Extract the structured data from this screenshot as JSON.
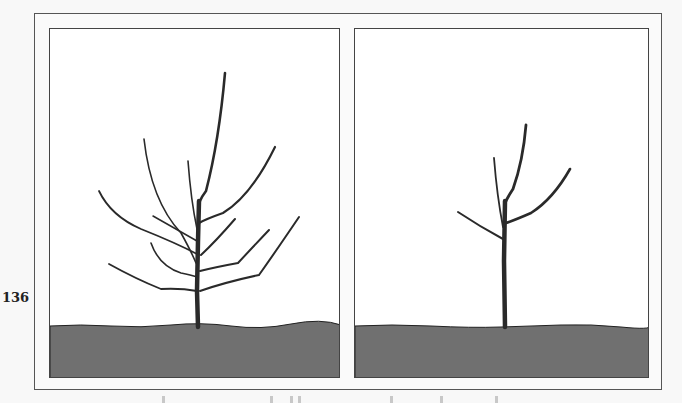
{
  "page": {
    "page_number": "136"
  },
  "figure": {
    "colors": {
      "frame": "#555555",
      "panel_border": "#444444",
      "panel_background": "#ffffff",
      "ground": "#707070",
      "branch": "#2a2a2a"
    },
    "panels": [
      {
        "id": "before-pruning",
        "state": "unpruned tree with many branches",
        "branch_count": 10
      },
      {
        "id": "after-pruning",
        "state": "pruned tree with leader and three scaffold branches",
        "branch_count": 4
      }
    ]
  },
  "caption": {
    "visible": "partially cut off at bottom edge, unreadable"
  }
}
